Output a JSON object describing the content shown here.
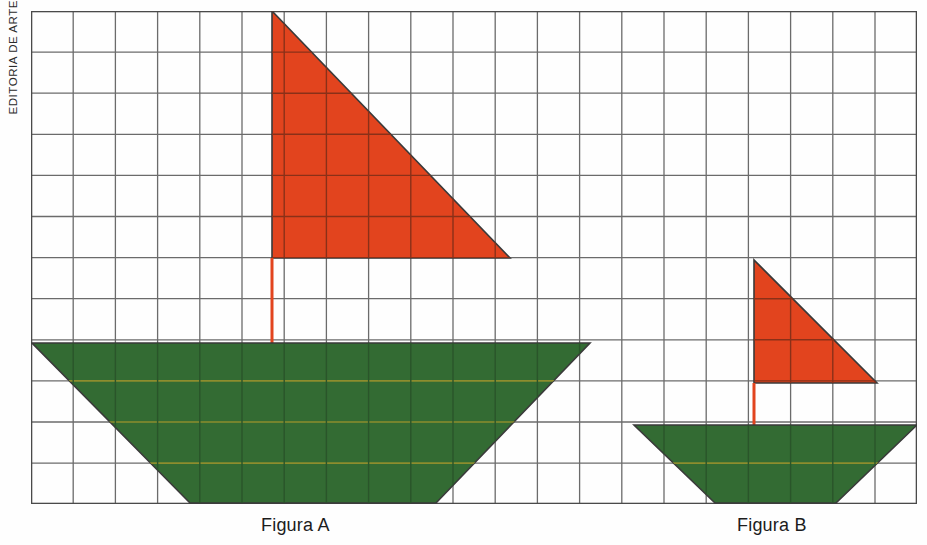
{
  "credit": {
    "text": "EDITORIA DE ARTE"
  },
  "labels": {
    "figure_a": "Figura A",
    "figure_b": "Figura B"
  },
  "colors": {
    "sail_red": "#E2441E",
    "hull_green": "#336B33",
    "grid_line": "#6b6b6b",
    "grid_line_on_green": "#8d8d2e",
    "outline": "#3a3a3a",
    "mast_red": "#E2441E",
    "background": "#fefefe"
  },
  "grid": {
    "columns": 21,
    "rows": 12,
    "cell_width": 42.2,
    "cell_height": 41.1,
    "origin_x": 31,
    "origin_y": 11,
    "width": 886,
    "height": 493
  },
  "figures": [
    {
      "id": "figure-a",
      "name": "Figura A",
      "scale_label": "2x",
      "sail": {
        "shape": "right-triangle",
        "points": "241,0 241,247 479,247",
        "cells_wide": 6,
        "cells_tall": 6
      },
      "mast": {
        "x": 241,
        "y_top": 247,
        "y_bottom": 332,
        "thickness": 3
      },
      "hull": {
        "shape": "trapezoid",
        "points": "1,332 559,332 405,492 159,492",
        "top_cells": 13,
        "bottom_cells": 6,
        "height_cells": 4
      }
    },
    {
      "id": "figure-b",
      "name": "Figura B",
      "scale_label": "1x",
      "sail": {
        "shape": "right-triangle",
        "points": "723,249 723,372 846,372",
        "cells_wide": 3,
        "cells_tall": 3
      },
      "mast": {
        "x": 723,
        "y_top": 372,
        "y_bottom": 414,
        "thickness": 3
      },
      "hull": {
        "shape": "trapezoid",
        "points": "603,414 886,414 805,492 684,492",
        "top_cells": 7,
        "bottom_cells": 3,
        "height_cells": 2
      }
    }
  ]
}
